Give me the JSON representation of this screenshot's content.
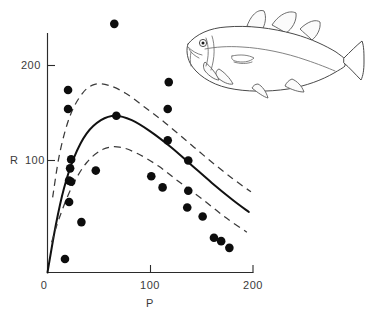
{
  "figure": {
    "top_caption": "",
    "background_color": "#ffffff"
  },
  "axes": {
    "x_label": "P",
    "y_label": "R",
    "x_ticks": [
      "0",
      "100",
      "200"
    ],
    "x_tick_values": [
      0,
      100,
      200
    ],
    "y_ticks": [
      "100",
      "200"
    ],
    "y_tick_values": [
      100,
      200
    ],
    "origin_label": "0"
  },
  "illustration": {
    "name": "atlantic-cod-line-drawing",
    "subject": "cod fish",
    "stroke_color": "#4a4a4a"
  },
  "chart_data": {
    "type": "scatter",
    "title": "",
    "subtitle": "",
    "xlabel": "P",
    "ylabel": "R",
    "xlim": [
      0,
      200
    ],
    "ylim": [
      0,
      235
    ],
    "grid": false,
    "legend": null,
    "x_ticks": [
      0,
      100,
      200
    ],
    "y_ticks": [
      100,
      200
    ],
    "points": [
      {
        "x": 65,
        "y": 222
      },
      {
        "x": 20,
        "y": 163
      },
      {
        "x": 20,
        "y": 146
      },
      {
        "x": 118,
        "y": 170
      },
      {
        "x": 117,
        "y": 146
      },
      {
        "x": 67,
        "y": 140
      },
      {
        "x": 117,
        "y": 118
      },
      {
        "x": 23,
        "y": 101
      },
      {
        "x": 22,
        "y": 93
      },
      {
        "x": 137,
        "y": 100
      },
      {
        "x": 47,
        "y": 91
      },
      {
        "x": 21,
        "y": 82
      },
      {
        "x": 23,
        "y": 81
      },
      {
        "x": 101,
        "y": 86
      },
      {
        "x": 112,
        "y": 76
      },
      {
        "x": 137,
        "y": 73
      },
      {
        "x": 21,
        "y": 63
      },
      {
        "x": 136,
        "y": 58
      },
      {
        "x": 151,
        "y": 50
      },
      {
        "x": 33,
        "y": 45
      },
      {
        "x": 162,
        "y": 31
      },
      {
        "x": 169,
        "y": 28
      },
      {
        "x": 177,
        "y": 22
      },
      {
        "x": 17,
        "y": 12
      }
    ],
    "curves": [
      {
        "name": "fitted-stock-recruitment-curve",
        "style": "solid",
        "points": [
          {
            "x": 0,
            "y": 0
          },
          {
            "x": 8,
            "y": 42
          },
          {
            "x": 16,
            "y": 75
          },
          {
            "x": 26,
            "y": 103
          },
          {
            "x": 38,
            "y": 124
          },
          {
            "x": 52,
            "y": 136
          },
          {
            "x": 66,
            "y": 140
          },
          {
            "x": 82,
            "y": 136
          },
          {
            "x": 100,
            "y": 126
          },
          {
            "x": 120,
            "y": 112
          },
          {
            "x": 140,
            "y": 96
          },
          {
            "x": 160,
            "y": 80
          },
          {
            "x": 180,
            "y": 65
          },
          {
            "x": 196,
            "y": 54
          }
        ]
      },
      {
        "name": "upper-confidence-limit",
        "style": "dashed",
        "points": [
          {
            "x": 5,
            "y": 67
          },
          {
            "x": 12,
            "y": 107
          },
          {
            "x": 22,
            "y": 140
          },
          {
            "x": 34,
            "y": 160
          },
          {
            "x": 46,
            "y": 168
          },
          {
            "x": 60,
            "y": 167
          },
          {
            "x": 76,
            "y": 160
          },
          {
            "x": 94,
            "y": 148
          },
          {
            "x": 114,
            "y": 134
          },
          {
            "x": 136,
            "y": 117
          },
          {
            "x": 158,
            "y": 100
          },
          {
            "x": 180,
            "y": 84
          },
          {
            "x": 198,
            "y": 72
          }
        ]
      },
      {
        "name": "lower-confidence-limit",
        "style": "dashed",
        "points": [
          {
            "x": 4,
            "y": 27
          },
          {
            "x": 12,
            "y": 50
          },
          {
            "x": 24,
            "y": 77
          },
          {
            "x": 38,
            "y": 98
          },
          {
            "x": 54,
            "y": 110
          },
          {
            "x": 70,
            "y": 112
          },
          {
            "x": 88,
            "y": 106
          },
          {
            "x": 108,
            "y": 95
          },
          {
            "x": 128,
            "y": 81
          },
          {
            "x": 150,
            "y": 66
          },
          {
            "x": 172,
            "y": 50
          },
          {
            "x": 194,
            "y": 36
          }
        ]
      }
    ]
  }
}
